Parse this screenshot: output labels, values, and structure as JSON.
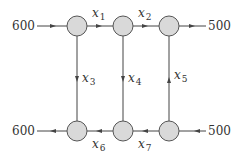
{
  "diagram": {
    "type": "network-flow",
    "colors": {
      "node_fill": "#d9d9d9",
      "node_stroke": "#555555",
      "edge": "#444444",
      "text": "#333333"
    },
    "nodes": [
      {
        "id": "A",
        "cx": 77,
        "cy": 26
      },
      {
        "id": "B",
        "cx": 123,
        "cy": 26
      },
      {
        "id": "C",
        "cx": 169,
        "cy": 26
      },
      {
        "id": "D",
        "cx": 77,
        "cy": 131
      },
      {
        "id": "E",
        "cx": 123,
        "cy": 131
      },
      {
        "id": "F",
        "cx": 169,
        "cy": 131
      }
    ],
    "external_flows": {
      "top_in": {
        "value": "600",
        "direction": "into A"
      },
      "top_out": {
        "value": "500",
        "direction": "out of C"
      },
      "bottom_out": {
        "value": "600",
        "direction": "out of D"
      },
      "bottom_in": {
        "value": "500",
        "direction": "into F"
      }
    },
    "edges": [
      {
        "var": "x",
        "sub": "1",
        "from": "A",
        "to": "B"
      },
      {
        "var": "x",
        "sub": "2",
        "from": "B",
        "to": "C"
      },
      {
        "var": "x",
        "sub": "3",
        "from": "A",
        "to": "D"
      },
      {
        "var": "x",
        "sub": "4",
        "from": "B",
        "to": "E"
      },
      {
        "var": "x",
        "sub": "5",
        "from": "F",
        "to": "C"
      },
      {
        "var": "x",
        "sub": "6",
        "from": "E",
        "to": "D"
      },
      {
        "var": "x",
        "sub": "7",
        "from": "F",
        "to": "E"
      }
    ]
  }
}
